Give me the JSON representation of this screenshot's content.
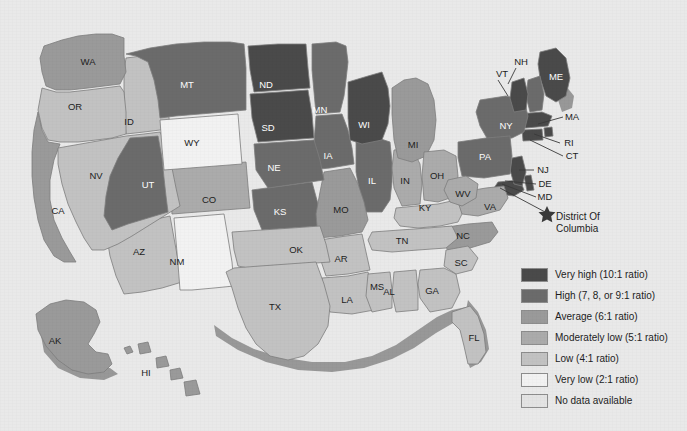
{
  "map": {
    "title": "United States choropleth map",
    "background_color": "#e9e9e9",
    "border_color": "#7d7d7d",
    "coast_shadow_color": "#8a8a8a",
    "dc_marker": {
      "icon": "star-icon",
      "line1": "District Of",
      "line2": "Columbia"
    },
    "states": [
      {
        "code": "AL",
        "label": "AL",
        "level": 4,
        "lx": 389,
        "ly": 292
      },
      {
        "code": "AK",
        "label": "AK",
        "level": 2,
        "lx": 55,
        "ly": 341
      },
      {
        "code": "AZ",
        "label": "AZ",
        "level": 4,
        "lx": 139,
        "ly": 252
      },
      {
        "code": "AR",
        "label": "AR",
        "level": 4,
        "lx": 341,
        "ly": 259
      },
      {
        "code": "CA",
        "label": "CA",
        "level": 2,
        "lx": 58,
        "ly": 211
      },
      {
        "code": "CO",
        "label": "CO",
        "level": 3,
        "lx": 209,
        "ly": 200
      },
      {
        "code": "CT",
        "label": "CT",
        "level": 0,
        "lx": 572,
        "ly": 156,
        "leader": true
      },
      {
        "code": "DE",
        "label": "DE",
        "level": 0,
        "lx": 545,
        "ly": 184,
        "leader": true
      },
      {
        "code": "FL",
        "label": "FL",
        "level": 4,
        "lx": 474,
        "ly": 338
      },
      {
        "code": "GA",
        "label": "GA",
        "level": 4,
        "lx": 432,
        "ly": 291
      },
      {
        "code": "HI",
        "label": "HI",
        "level": 2,
        "lx": 146,
        "ly": 373
      },
      {
        "code": "ID",
        "label": "ID",
        "level": 4,
        "lx": 129,
        "ly": 122
      },
      {
        "code": "IL",
        "label": "IL",
        "level": 1,
        "lx": 372,
        "ly": 181
      },
      {
        "code": "IN",
        "label": "IN",
        "level": 3,
        "lx": 405,
        "ly": 181
      },
      {
        "code": "IA",
        "label": "IA",
        "level": 1,
        "lx": 328,
        "ly": 156
      },
      {
        "code": "KS",
        "label": "KS",
        "level": 1,
        "lx": 280,
        "ly": 212
      },
      {
        "code": "KY",
        "label": "KY",
        "level": 4,
        "lx": 425,
        "ly": 208
      },
      {
        "code": "LA",
        "label": "LA",
        "level": 4,
        "lx": 347,
        "ly": 300
      },
      {
        "code": "ME",
        "label": "ME",
        "level": 0,
        "lx": 556,
        "ly": 77
      },
      {
        "code": "MD",
        "label": "MD",
        "level": 0,
        "lx": 545,
        "ly": 197,
        "leader": true
      },
      {
        "code": "MA",
        "label": "MA",
        "level": 0,
        "lx": 572,
        "ly": 117,
        "leader": true
      },
      {
        "code": "MI",
        "label": "MI",
        "level": 2,
        "lx": 413,
        "ly": 145
      },
      {
        "code": "MN",
        "label": "MN",
        "level": 1,
        "lx": 320,
        "ly": 110
      },
      {
        "code": "MS",
        "label": "MS",
        "level": 4,
        "lx": 377,
        "ly": 287
      },
      {
        "code": "MO",
        "label": "MO",
        "level": 2,
        "lx": 341,
        "ly": 210
      },
      {
        "code": "MT",
        "label": "MT",
        "level": 1,
        "lx": 187,
        "ly": 85
      },
      {
        "code": "NE",
        "label": "NE",
        "level": 1,
        "lx": 274,
        "ly": 168
      },
      {
        "code": "NV",
        "label": "NV",
        "level": 4,
        "lx": 96,
        "ly": 176
      },
      {
        "code": "NH",
        "label": "NH",
        "level": 1,
        "lx": 521,
        "ly": 62,
        "leader": true
      },
      {
        "code": "NJ",
        "label": "NJ",
        "level": 0,
        "lx": 543,
        "ly": 170,
        "leader": true
      },
      {
        "code": "NM",
        "label": "NM",
        "level": 5,
        "lx": 177,
        "ly": 262
      },
      {
        "code": "NY",
        "label": "NY",
        "level": 1,
        "lx": 506,
        "ly": 126
      },
      {
        "code": "NC",
        "label": "NC",
        "level": 2,
        "lx": 463,
        "ly": 236
      },
      {
        "code": "ND",
        "label": "ND",
        "level": 0,
        "lx": 266,
        "ly": 85
      },
      {
        "code": "OH",
        "label": "OH",
        "level": 3,
        "lx": 437,
        "ly": 176
      },
      {
        "code": "OK",
        "label": "OK",
        "level": 4,
        "lx": 296,
        "ly": 250
      },
      {
        "code": "OR",
        "label": "OR",
        "level": 4,
        "lx": 75,
        "ly": 107
      },
      {
        "code": "PA",
        "label": "PA",
        "level": 1,
        "lx": 485,
        "ly": 157
      },
      {
        "code": "RI",
        "label": "RI",
        "level": 0,
        "lx": 569,
        "ly": 143,
        "leader": true
      },
      {
        "code": "SC",
        "label": "SC",
        "level": 4,
        "lx": 461,
        "ly": 263
      },
      {
        "code": "SD",
        "label": "SD",
        "level": 0,
        "lx": 268,
        "ly": 128
      },
      {
        "code": "TN",
        "label": "TN",
        "level": 4,
        "lx": 402,
        "ly": 241
      },
      {
        "code": "TX",
        "label": "TX",
        "level": 4,
        "lx": 275,
        "ly": 307
      },
      {
        "code": "UT",
        "label": "UT",
        "level": 1,
        "lx": 148,
        "ly": 185
      },
      {
        "code": "VT",
        "label": "VT",
        "level": 0,
        "lx": 502,
        "ly": 74,
        "leader": true
      },
      {
        "code": "VA",
        "label": "VA",
        "level": 3,
        "lx": 490,
        "ly": 207
      },
      {
        "code": "WA",
        "label": "WA",
        "level": 2,
        "lx": 88,
        "ly": 62
      },
      {
        "code": "WV",
        "label": "WV",
        "level": 3,
        "lx": 463,
        "ly": 194
      },
      {
        "code": "WI",
        "label": "WI",
        "level": 0,
        "lx": 364,
        "ly": 125
      },
      {
        "code": "WY",
        "label": "WY",
        "level": 5,
        "lx": 192,
        "ly": 143
      }
    ]
  },
  "legend": {
    "items": [
      {
        "label": "Very high (10:1 ratio)",
        "color": "#4a4a4a"
      },
      {
        "label": "High (7, 8, or 9:1 ratio)",
        "color": "#6b6b6b"
      },
      {
        "label": "Average (6:1 ratio)",
        "color": "#9a9a9a"
      },
      {
        "label": "Moderately low (5:1 ratio)",
        "color": "#ababab"
      },
      {
        "label": "Low (4:1 ratio)",
        "color": "#c2c2c2"
      },
      {
        "label": "Very low (2:1 ratio)",
        "color": "#f2f2f2"
      },
      {
        "label": "No data available",
        "color": "#e3e3e3"
      }
    ]
  }
}
